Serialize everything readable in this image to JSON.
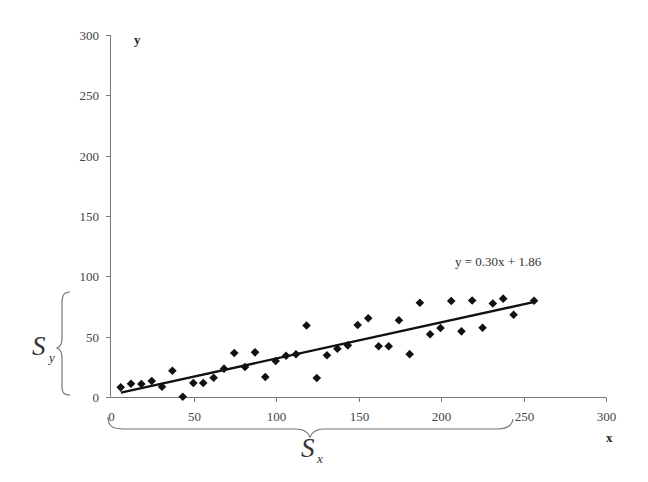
{
  "chart_data": {
    "type": "scatter",
    "title": "",
    "xlabel": "x",
    "ylabel": "y",
    "xlim": [
      0,
      300
    ],
    "ylim": [
      0,
      300
    ],
    "x_ticks": [
      0,
      50,
      100,
      150,
      200,
      250,
      300
    ],
    "y_ticks": [
      0,
      50,
      100,
      150,
      200,
      250,
      300
    ],
    "grid": false,
    "legend": null,
    "series": [
      {
        "name": "data",
        "marker": "diamond",
        "color": "#111111",
        "points": [
          [
            5.9,
            8.0
          ],
          [
            12.1,
            11.0
          ],
          [
            18.4,
            10.8
          ],
          [
            24.7,
            13.3
          ],
          [
            30.9,
            8.5
          ],
          [
            37.2,
            21.8
          ],
          [
            43.5,
            0.2
          ],
          [
            49.9,
            11.6
          ],
          [
            55.9,
            11.6
          ],
          [
            62.2,
            16.0
          ],
          [
            68.5,
            23.5
          ],
          [
            74.7,
            36.5
          ],
          [
            81.2,
            24.9
          ],
          [
            87.3,
            37.0
          ],
          [
            93.5,
            16.6
          ],
          [
            99.8,
            29.8
          ],
          [
            106.1,
            34.2
          ],
          [
            112.1,
            35.4
          ],
          [
            118.5,
            59.3
          ],
          [
            124.7,
            15.7
          ],
          [
            130.9,
            34.6
          ],
          [
            137.2,
            40.0
          ],
          [
            143.5,
            42.8
          ],
          [
            149.5,
            59.7
          ],
          [
            155.9,
            65.2
          ],
          [
            162.2,
            42.0
          ],
          [
            168.3,
            42.0
          ],
          [
            174.5,
            63.6
          ],
          [
            181.0,
            35.5
          ],
          [
            187.2,
            78.1
          ],
          [
            193.4,
            52.0
          ],
          [
            199.7,
            57.2
          ],
          [
            206.2,
            79.6
          ],
          [
            212.4,
            54.4
          ],
          [
            218.9,
            80.0
          ],
          [
            225.2,
            57.4
          ],
          [
            231.4,
            77.5
          ],
          [
            237.7,
            81.5
          ],
          [
            244.0,
            68.1
          ],
          [
            256.4,
            79.8
          ]
        ]
      }
    ],
    "trendline": {
      "type": "linear",
      "slope": 0.3,
      "intercept": 1.86,
      "x_range": [
        6,
        256
      ],
      "color": "#111111"
    },
    "annotations": [
      {
        "text": "y = 0.30x + 1.86",
        "role": "trendline-equation"
      },
      {
        "text": "S",
        "subscript": "y",
        "role": "y-spread-brace",
        "y_range": [
          0,
          85
        ]
      },
      {
        "text": "S",
        "subscript": "x",
        "role": "x-spread-brace",
        "x_range": [
          0,
          245
        ]
      }
    ]
  },
  "labels": {
    "x_axis_title": "x",
    "y_axis_title": "y",
    "equation": "y = 0.30x + 1.86",
    "sy_main": "S",
    "sy_sub": "y",
    "sx_main": "S",
    "sx_sub": "x"
  },
  "layout": {
    "plot_left_px": 111,
    "plot_bottom_px": 397,
    "x_px_per_unit": 1.65,
    "y_px_per_unit": 1.2067
  }
}
